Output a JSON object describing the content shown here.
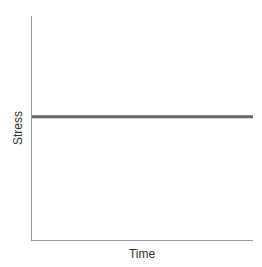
{
  "chart_data": {
    "type": "line",
    "title": "",
    "xlabel": "Time",
    "ylabel": "Stress",
    "x": [
      0,
      1
    ],
    "series": [
      {
        "name": "Stress",
        "values": [
          0.55,
          0.55
        ],
        "color": "#666666"
      }
    ],
    "xlim": [
      0,
      1
    ],
    "ylim": [
      0,
      1
    ],
    "grid": false,
    "legend": "none",
    "ticks": "none"
  },
  "colors": {
    "axis": "#999999",
    "line": "#666666",
    "text": "#333333"
  }
}
